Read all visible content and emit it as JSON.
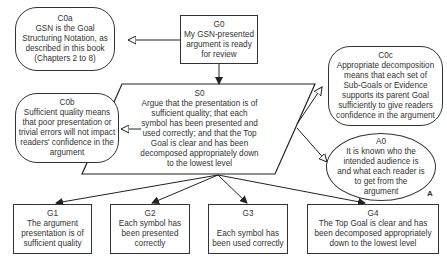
{
  "nodes": {
    "G0": {
      "id": "G0",
      "text": "My GSN-presented\nargument is ready\nfor review"
    },
    "C0a": {
      "id": "C0a",
      "text": "GSN is the Goal\nStructuring Notation, as\ndescribed in this book\n(Chapters 2 to 8)"
    },
    "S0": {
      "id": "S0",
      "text": "Argue that the presentation is of\nsufficient quality; that each\nsymbol has been presented and\nused correctly; and that the Top\nGoal is clear and has been\ndecomposed appropriately down\nto the lowest level"
    },
    "C0b": {
      "id": "C0b",
      "text": "Sufficient quality means\nthat poor presentation or\ntrivial errors will not impact\nreaders' confidence in the\nargument"
    },
    "C0c": {
      "id": "C0c",
      "text": "Appropriate decomposition\nmeans that each set of\nSub-Goals or Evidence\nsupports its parent Goal\nsufficiently to give readers\nconfidence in the argument"
    },
    "A0": {
      "id": "A0",
      "text": "It is known who the\nintended audience is\nand what each reader is\nto get from the\nargument",
      "marker": "A"
    },
    "G1": {
      "id": "G1",
      "text": "The argument\npresentation is of\nsufficient quality"
    },
    "G2": {
      "id": "G2",
      "text": "Each symbol has\nbeen presented\ncorrectly"
    },
    "G3": {
      "id": "G3",
      "text": "\nEach symbol has\nbeen used correctly"
    },
    "G4": {
      "id": "G4",
      "text": "The Top Goal is clear and has\nbeen decomposed appropriately\ndown to the lowest level"
    }
  }
}
